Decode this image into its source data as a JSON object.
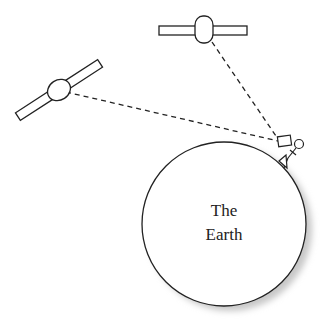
{
  "diagram": {
    "earth_label_line1": "The",
    "earth_label_line2": "Earth",
    "elements": [
      "satellite-left",
      "satellite-top",
      "ground-receiver-person",
      "earth-circle",
      "signal-lines"
    ],
    "colors": {
      "stroke": "#222222",
      "shadow": "#cfcfcf",
      "background": "#ffffff"
    }
  }
}
